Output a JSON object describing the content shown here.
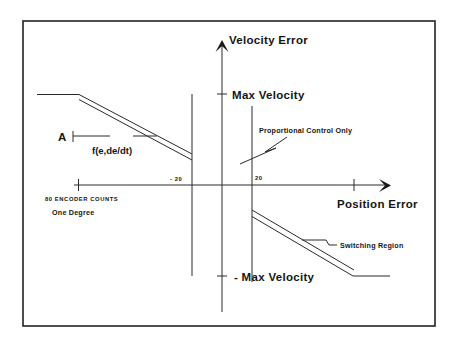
{
  "diagram": {
    "type": "phase-plane control law diagram",
    "axes": {
      "y_label": "Velocity Error",
      "x_label": "Position Error",
      "y_ticks": {
        "max": "Max Velocity",
        "min": "- Max Velocity"
      },
      "x_ticks": {
        "neg": "- 20",
        "pos": "20"
      }
    },
    "annotations": {
      "a_label": "A",
      "function_label": "f(e,de/dt)",
      "proportional": "Proportional Control Only",
      "switching": "Switching Region",
      "encoder_counts": "80 ENCODER COUNTS",
      "one_degree": "One Degree"
    },
    "colors": {
      "line": "#2a2a2a",
      "text": "#151515",
      "background": "#ffffff"
    }
  }
}
